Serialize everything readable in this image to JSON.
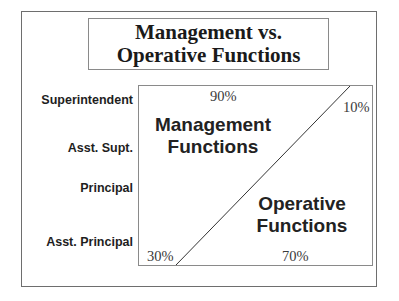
{
  "title": {
    "line1": "Management vs.",
    "line2": "Operative Functions"
  },
  "rows": [
    {
      "label": "Superintendent"
    },
    {
      "label": "Asst. Supt."
    },
    {
      "label": "Principal"
    },
    {
      "label": "Asst. Principal"
    }
  ],
  "regions": {
    "management": {
      "line1": "Management",
      "line2": "Functions"
    },
    "operative": {
      "line1": "Operative",
      "line2": "Functions"
    }
  },
  "percentages": {
    "top_management": "90%",
    "top_operative": "10%",
    "bottom_management": "30%",
    "bottom_operative": "70%"
  },
  "colors": {
    "border": "#8a8a8a",
    "line": "#333333",
    "text": "#1e1e1e"
  }
}
